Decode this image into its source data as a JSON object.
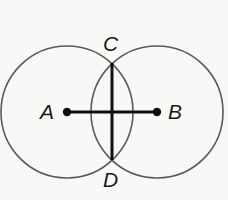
{
  "figure": {
    "canvas": {
      "width": 228,
      "height": 200,
      "background": "#f8f8f6"
    },
    "style": {
      "circle_stroke": "#5a5a5a",
      "circle_stroke_width": 1.6,
      "circle_fill": "none",
      "segment_color": "#111111",
      "segment_width": 3.2,
      "chord_color": "#111111",
      "chord_width": 3.0,
      "point_color": "#111111",
      "point_radius": 4.2,
      "label_color": "#1a1a1a"
    },
    "circles": [
      {
        "id": "circle-A",
        "center_label": "A",
        "cx": 67,
        "cy": 112,
        "r": 66
      },
      {
        "id": "circle-B",
        "center_label": "B",
        "cx": 157,
        "cy": 112,
        "r": 66
      }
    ],
    "points": [
      {
        "id": "point-A",
        "label": "A",
        "x": 67,
        "y": 112,
        "kind": "center",
        "dot": true
      },
      {
        "id": "point-B",
        "label": "B",
        "x": 157,
        "y": 112,
        "kind": "center",
        "dot": true
      },
      {
        "id": "point-C",
        "label": "C",
        "x": 112,
        "y": 63,
        "kind": "intersection",
        "dot": false
      },
      {
        "id": "point-D",
        "label": "D",
        "x": 112,
        "y": 160,
        "kind": "intersection",
        "dot": false
      }
    ],
    "segments": [
      {
        "id": "segment-AB",
        "from": "A",
        "to": "B",
        "x1": 67,
        "y1": 112,
        "x2": 157,
        "y2": 112
      },
      {
        "id": "segment-CD",
        "from": "C",
        "to": "D",
        "x1": 112,
        "y1": 63,
        "x2": 112,
        "y2": 160
      }
    ],
    "labels": {
      "A": "A",
      "B": "B",
      "C": "C",
      "D": "D"
    }
  }
}
